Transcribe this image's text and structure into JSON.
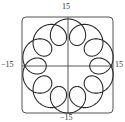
{
  "chart_data": {
    "type": "line",
    "subtype": "parametric",
    "title": "",
    "xlabel": "",
    "ylabel": "",
    "equation": {
      "x": "11 cos t - 4 cos(11 t)",
      "y": "11 sin t - 4 sin(11 t)",
      "t_range": [
        0,
        6.283185307
      ]
    },
    "params": {
      "a": 11,
      "b": 4,
      "k": 11
    },
    "xlim": [
      -15,
      15
    ],
    "ylim": [
      -15,
      15
    ],
    "tick_labels": {
      "x_min": "−15",
      "x_max": "15",
      "y_max": "15",
      "y_min": "−15"
    },
    "loops": 10,
    "grid": false,
    "frame": "rounded-box",
    "colors": {
      "curve": "#2a2a2a",
      "axes": "#444444",
      "frame": "#555555"
    }
  }
}
